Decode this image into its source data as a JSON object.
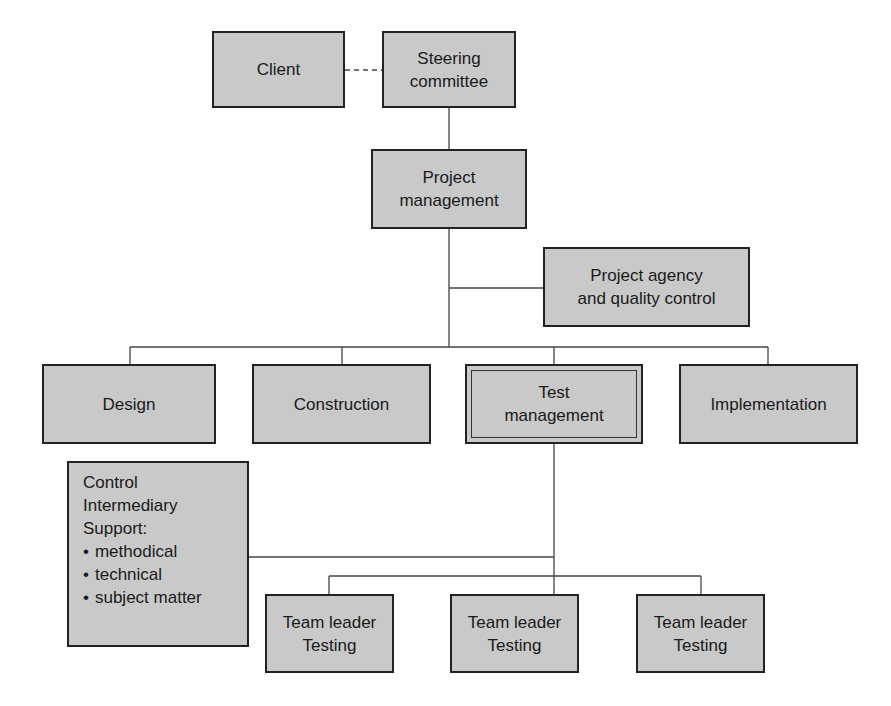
{
  "diagram": {
    "type": "org-chart",
    "nodes": {
      "client": "Client",
      "steering": "Steering\ncommittee",
      "project_management": "Project\nmanagement",
      "agency": "Project agency\nand quality control",
      "design": "Design",
      "construction": "Construction",
      "test_management": "Test\nmanagement",
      "implementation": "Implementation",
      "control": {
        "lines": [
          "Control",
          "Intermediary",
          "Support:"
        ],
        "bullets": [
          "methodical",
          "technical",
          "subject matter"
        ]
      },
      "team_leaders": [
        "Team leader\nTesting",
        "Team leader\nTesting",
        "Team leader\nTesting"
      ]
    },
    "edges": [
      {
        "from": "client",
        "to": "steering",
        "style": "dashed"
      },
      {
        "from": "steering",
        "to": "project_management",
        "style": "solid"
      },
      {
        "from": "project_management",
        "to": "agency",
        "style": "solid"
      },
      {
        "from": "project_management",
        "to": "design",
        "style": "solid"
      },
      {
        "from": "project_management",
        "to": "construction",
        "style": "solid"
      },
      {
        "from": "project_management",
        "to": "test_management",
        "style": "solid"
      },
      {
        "from": "project_management",
        "to": "implementation",
        "style": "solid"
      },
      {
        "from": "test_management",
        "to": "control",
        "style": "solid"
      },
      {
        "from": "test_management",
        "to": "team_leader_1",
        "style": "solid"
      },
      {
        "from": "test_management",
        "to": "team_leader_2",
        "style": "solid"
      },
      {
        "from": "test_management",
        "to": "team_leader_3",
        "style": "solid"
      }
    ],
    "colors": {
      "box_fill": "#c9c9c9",
      "border": "#222222",
      "line": "#444444"
    }
  }
}
